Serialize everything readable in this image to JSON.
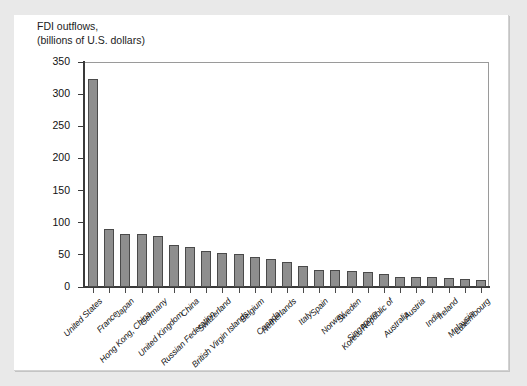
{
  "chart_data": {
    "type": "bar",
    "title": "FDI outflows,",
    "subtitle": "(billions of U.S. dollars)",
    "xlabel": "",
    "ylabel": "",
    "ylim": [
      0,
      350
    ],
    "yticks": [
      0,
      50,
      100,
      150,
      200,
      250,
      300,
      350
    ],
    "grid": false,
    "legend": "none",
    "bar_color": "#8e8e8e",
    "bar_edge_color": "#4a4a4a",
    "categories": [
      "United States",
      "France",
      "Japan",
      "Hong Kong, China",
      "Germany",
      "United Kingdom",
      "China",
      "Russian Federation",
      "Switzerland",
      "British Virgin Islands",
      "Belgium",
      "Canada",
      "Netherlands",
      "Italy",
      "Spain",
      "Norway",
      "Sweden",
      "Singapore",
      "Korea, Republic of",
      "Australia",
      "Austria",
      "India",
      "Ireland",
      "Malaysia",
      "Luxembourg"
    ],
    "values": [
      324,
      91,
      83,
      82,
      80,
      65,
      63,
      56,
      53,
      51,
      46,
      43,
      39,
      32,
      27,
      26,
      25,
      23,
      21,
      16,
      15,
      15,
      14,
      13,
      11
    ]
  },
  "chart": {
    "title_line1": "FDI outflows,",
    "title_line2": "(billions of U.S. dollars)"
  }
}
